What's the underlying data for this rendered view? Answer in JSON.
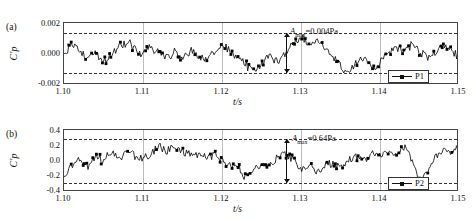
{
  "figure": {
    "panels": [
      {
        "tag": "(a)",
        "ylabel": "C'p",
        "xlabel": "t/s",
        "yticks": [
          "0.002",
          "0.000",
          "-0.002"
        ],
        "ytick_values": [
          0.002,
          0.0,
          -0.002
        ],
        "xticks": [
          "1.10",
          "1.11",
          "1.12",
          "1.13",
          "1.14",
          "1.15"
        ],
        "xtick_values": [
          1.1,
          1.11,
          1.12,
          1.13,
          1.14,
          1.15
        ],
        "annotation": "Amax=0.004Pa",
        "annotation_symbol": "A",
        "annotation_sub": "max",
        "annotation_value": "=0.004Pa",
        "legend_label": "P1",
        "envelope_upper": 0.002,
        "envelope_lower": -0.002
      },
      {
        "tag": "(b)",
        "ylabel": "C'p",
        "xlabel": "t/s",
        "yticks": [
          "0.4",
          "0.2",
          "0.0",
          "-0.2",
          "-0.4"
        ],
        "ytick_values": [
          0.4,
          0.2,
          0.0,
          -0.2,
          -0.4
        ],
        "xticks": [
          "1.10",
          "1.11",
          "1.12",
          "1.13",
          "1.14",
          "1.15"
        ],
        "xtick_values": [
          1.1,
          1.11,
          1.12,
          1.13,
          1.14,
          1.15
        ],
        "annotation": "Amax=0.64Pa",
        "annotation_symbol": "A",
        "annotation_sub": "max",
        "annotation_value": "=0.64Pa",
        "legend_label": "P2",
        "envelope_upper": 0.32,
        "envelope_lower": -0.32
      }
    ]
  },
  "chart_data": [
    {
      "type": "line",
      "title": "",
      "panel": "(a)",
      "xlabel": "t/s",
      "ylabel": "C'p",
      "xlim": [
        1.1,
        1.15
      ],
      "ylim": [
        -0.003,
        0.003
      ],
      "yticks": [
        0.002,
        0.0,
        -0.002
      ],
      "xticks": [
        1.1,
        1.11,
        1.12,
        1.13,
        1.14,
        1.15
      ],
      "grid": false,
      "legend": [
        "P1"
      ],
      "legend_position": "bottom-right",
      "annotations": [
        {
          "text": "Amax=0.004Pa",
          "x": 1.128,
          "y": 0.0022,
          "type": "double-arrow",
          "arrow_from": 0.002,
          "arrow_to": -0.002
        }
      ],
      "reference_lines": [
        {
          "y": 0.002,
          "style": "dashed"
        },
        {
          "y": -0.002,
          "style": "dashed"
        }
      ],
      "series": [
        {
          "name": "P1",
          "x": [
            1.1,
            1.101,
            1.102,
            1.103,
            1.104,
            1.105,
            1.106,
            1.107,
            1.108,
            1.109,
            1.11,
            1.111,
            1.112,
            1.113,
            1.114,
            1.115,
            1.116,
            1.117,
            1.118,
            1.119,
            1.12,
            1.121,
            1.122,
            1.123,
            1.124,
            1.125,
            1.126,
            1.127,
            1.128,
            1.129,
            1.13,
            1.131,
            1.132,
            1.133,
            1.134,
            1.135,
            1.136,
            1.137,
            1.138,
            1.139,
            1.14,
            1.141,
            1.142,
            1.143,
            1.144,
            1.145,
            1.146,
            1.147,
            1.148,
            1.149,
            1.15
          ],
          "values": [
            -0.0002,
            0.0008,
            0.0004,
            -0.0005,
            0.0003,
            -0.0008,
            -0.0002,
            0.0006,
            0.0012,
            0.0005,
            -0.0001,
            0.0007,
            0.0002,
            -0.0004,
            0.0001,
            -0.0003,
            0.0004,
            -0.0002,
            -0.0006,
            0.0002,
            0.0008,
            0.0003,
            -0.0005,
            -0.001,
            -0.0016,
            -0.0009,
            -0.0003,
            -0.0008,
            0.0002,
            0.001,
            0.0016,
            0.0009,
            0.0014,
            0.0006,
            -0.0004,
            -0.0012,
            -0.0018,
            -0.001,
            -0.0004,
            -0.0014,
            -0.0008,
            0.0,
            0.0007,
            0.0002,
            0.0009,
            0.0003,
            -0.0004,
            0.0002,
            0.0008,
            0.0004,
            -0.0003
          ]
        }
      ]
    },
    {
      "type": "line",
      "title": "",
      "panel": "(b)",
      "xlabel": "t/s",
      "ylabel": "C'p",
      "xlim": [
        1.1,
        1.15
      ],
      "ylim": [
        -0.45,
        0.45
      ],
      "yticks": [
        0.4,
        0.2,
        0.0,
        -0.2,
        -0.4
      ],
      "xticks": [
        1.1,
        1.11,
        1.12,
        1.13,
        1.14,
        1.15
      ],
      "grid": false,
      "legend": [
        "P2"
      ],
      "legend_position": "bottom-right",
      "annotations": [
        {
          "text": "Amax=0.64Pa",
          "x": 1.128,
          "y": 0.34,
          "type": "double-arrow",
          "arrow_from": 0.32,
          "arrow_to": -0.32
        }
      ],
      "reference_lines": [
        {
          "y": 0.32,
          "style": "dashed"
        },
        {
          "y": -0.32,
          "style": "dashed"
        }
      ],
      "series": [
        {
          "name": "P2",
          "x": [
            1.1,
            1.101,
            1.102,
            1.103,
            1.104,
            1.105,
            1.106,
            1.107,
            1.108,
            1.109,
            1.11,
            1.111,
            1.112,
            1.113,
            1.114,
            1.115,
            1.116,
            1.117,
            1.118,
            1.119,
            1.12,
            1.121,
            1.122,
            1.123,
            1.124,
            1.125,
            1.126,
            1.127,
            1.128,
            1.129,
            1.13,
            1.131,
            1.132,
            1.133,
            1.134,
            1.135,
            1.136,
            1.137,
            1.138,
            1.139,
            1.14,
            1.141,
            1.142,
            1.143,
            1.144,
            1.145,
            1.146,
            1.147,
            1.148,
            1.149,
            1.15
          ],
          "values": [
            -0.22,
            -0.08,
            0.02,
            -0.06,
            0.06,
            0.02,
            0.12,
            0.06,
            0.14,
            0.08,
            0.04,
            0.1,
            0.2,
            0.14,
            0.24,
            0.16,
            0.08,
            0.12,
            0.04,
            0.1,
            0.02,
            -0.1,
            -0.04,
            -0.26,
            -0.14,
            -0.04,
            -0.1,
            0.04,
            0.1,
            0.02,
            -0.12,
            -0.06,
            -0.16,
            -0.08,
            -0.02,
            -0.1,
            0.0,
            0.08,
            0.02,
            0.12,
            0.06,
            0.16,
            0.1,
            0.2,
            0.04,
            -0.3,
            -0.12,
            0.06,
            0.18,
            0.1,
            0.22
          ]
        }
      ]
    }
  ]
}
